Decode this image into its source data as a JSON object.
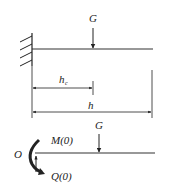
{
  "diagram": {
    "type": "cantilever beam free-body diagram",
    "top_figure": {
      "support": "fixed-wall",
      "load_label": "G",
      "dimension_partial_label": "h",
      "dimension_partial_subscript": "c",
      "dimension_total_label": "h"
    },
    "bottom_figure": {
      "origin_label": "O",
      "moment_label": "M(0)",
      "shear_label": "Q(0)",
      "load_label": "G"
    },
    "colors": {
      "stroke": "#222222",
      "background": "#ffffff"
    }
  }
}
